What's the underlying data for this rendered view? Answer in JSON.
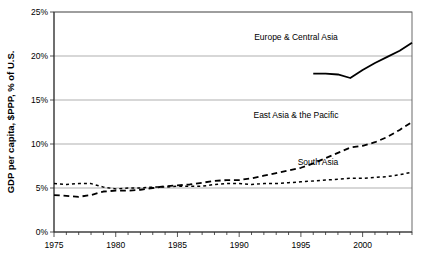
{
  "chart_data": {
    "type": "line",
    "title": "",
    "xlabel": "",
    "ylabel": "GDP per capita, $PPP, % of U.S.",
    "xlim": [
      1975,
      2004
    ],
    "ylim": [
      0,
      25
    ],
    "grid": true,
    "legend_position": "inline-annotations",
    "y_ticks": [
      "0%",
      "5%",
      "10%",
      "15%",
      "20%",
      "25%"
    ],
    "y_tick_values": [
      0,
      5,
      10,
      15,
      20,
      25
    ],
    "x_ticks": [
      "1975",
      "1980",
      "1985",
      "1990",
      "1995",
      "2000"
    ],
    "x_tick_values": [
      1975,
      1980,
      1985,
      1990,
      1995,
      2000
    ],
    "x_minor_tick_interval": 1,
    "series": [
      {
        "name": "Europe & Central Asia",
        "style": "solid",
        "width": 1.8,
        "color": "#000000",
        "x": [
          1996,
          1997,
          1998,
          1999,
          2000,
          2001,
          2002,
          2003,
          2004
        ],
        "values": [
          18.0,
          18.0,
          17.9,
          17.5,
          18.4,
          19.2,
          19.9,
          20.6,
          21.5
        ]
      },
      {
        "name": "East Asia & the Pacific",
        "style": "dashed",
        "width": 1.8,
        "color": "#000000",
        "x": [
          1975,
          1976,
          1977,
          1978,
          1979,
          1980,
          1981,
          1982,
          1983,
          1984,
          1985,
          1986,
          1987,
          1988,
          1989,
          1990,
          1991,
          1992,
          1993,
          1994,
          1995,
          1996,
          1997,
          1998,
          1999,
          2000,
          2001,
          2002,
          2003,
          2004
        ],
        "values": [
          4.2,
          4.1,
          4.0,
          4.2,
          4.6,
          4.7,
          4.7,
          4.8,
          5.0,
          5.2,
          5.3,
          5.4,
          5.6,
          5.8,
          5.9,
          5.9,
          6.1,
          6.4,
          6.7,
          7.0,
          7.3,
          7.8,
          8.4,
          9.0,
          9.6,
          9.8,
          10.2,
          10.8,
          11.6,
          12.5
        ]
      },
      {
        "name": "South Asia",
        "style": "dotted",
        "width": 1.5,
        "color": "#000000",
        "x": [
          1975,
          1976,
          1977,
          1978,
          1979,
          1980,
          1981,
          1982,
          1983,
          1984,
          1985,
          1986,
          1987,
          1988,
          1989,
          1990,
          1991,
          1992,
          1993,
          1994,
          1995,
          1996,
          1997,
          1998,
          1999,
          2000,
          2001,
          2002,
          2003,
          2004
        ],
        "values": [
          5.5,
          5.4,
          5.5,
          5.5,
          5.1,
          4.9,
          5.0,
          5.0,
          5.1,
          5.1,
          5.2,
          5.2,
          5.2,
          5.4,
          5.5,
          5.5,
          5.4,
          5.5,
          5.5,
          5.6,
          5.7,
          5.8,
          5.9,
          6.0,
          6.1,
          6.1,
          6.2,
          6.3,
          6.5,
          6.8
        ]
      }
    ],
    "annotations": [
      {
        "text": "Europe & Central Asia",
        "x": 296,
        "y": 40
      },
      {
        "text": "East Asia & the Pacific",
        "x": 296,
        "y": 118
      },
      {
        "text": "South Asia",
        "x": 318,
        "y": 165
      }
    ]
  }
}
